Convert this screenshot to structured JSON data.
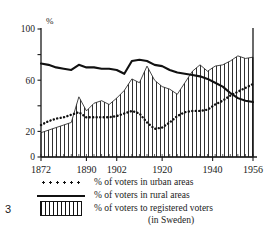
{
  "figure": {
    "number": "3"
  },
  "chart_data": {
    "type": "line",
    "title": "",
    "xlabel": "",
    "ylabel": "%",
    "unit_label": "%",
    "xlim": [
      1872,
      1956
    ],
    "ylim": [
      0,
      100
    ],
    "grid": false,
    "legend_position": "below",
    "y_ticks": [
      0,
      20,
      40,
      60,
      80,
      100
    ],
    "y_tick_labels": [
      "0",
      "20",
      "",
      "60",
      "",
      "100"
    ],
    "x_ticks": [
      1872,
      1890,
      1902,
      1920,
      1940,
      1956
    ],
    "x_tick_labels": [
      "1872",
      "1890",
      "1902",
      "1920",
      "1940",
      "1956"
    ],
    "annotation": "(in Sweden)",
    "series": [
      {
        "name": "% of voters in urban areas",
        "style": "dotted",
        "color": "#111111",
        "x": [
          1872,
          1875,
          1878,
          1881,
          1884,
          1887,
          1890,
          1893,
          1896,
          1899,
          1902,
          1905,
          1908,
          1911,
          1914,
          1917,
          1920,
          1923,
          1926,
          1929,
          1932,
          1935,
          1938,
          1941,
          1944,
          1947,
          1950,
          1953,
          1956
        ],
        "values": [
          25,
          28,
          30,
          31,
          33,
          35,
          31,
          31,
          31,
          31,
          32,
          34,
          36,
          34,
          27,
          22,
          23,
          27,
          32,
          35,
          36,
          36,
          37,
          41,
          44,
          48,
          51,
          54,
          57
        ]
      },
      {
        "name": "% of voters in rural areas",
        "style": "solid",
        "color": "#111111",
        "x": [
          1872,
          1875,
          1878,
          1881,
          1884,
          1887,
          1890,
          1893,
          1896,
          1899,
          1902,
          1905,
          1908,
          1911,
          1914,
          1917,
          1920,
          1923,
          1926,
          1929,
          1932,
          1935,
          1938,
          1941,
          1944,
          1947,
          1950,
          1953,
          1956
        ],
        "values": [
          73,
          72,
          70,
          69,
          68,
          72,
          70,
          70,
          69,
          69,
          68,
          65,
          75,
          76,
          75,
          72,
          71,
          68,
          66,
          65,
          64,
          63,
          61,
          58,
          55,
          50,
          46,
          44,
          43
        ]
      },
      {
        "name": "% of voters to registered voters",
        "style": "hatched-area",
        "color": "#111111",
        "x": [
          1872,
          1875,
          1878,
          1881,
          1884,
          1887,
          1890,
          1893,
          1896,
          1899,
          1902,
          1905,
          1908,
          1911,
          1914,
          1917,
          1920,
          1923,
          1926,
          1929,
          1932,
          1935,
          1938,
          1941,
          1944,
          1947,
          1950,
          1953,
          1956
        ],
        "values": [
          19,
          21,
          23,
          25,
          27,
          47,
          36,
          42,
          44,
          41,
          46,
          52,
          61,
          58,
          71,
          60,
          55,
          53,
          49,
          58,
          67,
          72,
          67,
          71,
          72,
          75,
          79,
          77,
          78
        ]
      }
    ]
  },
  "legend": {
    "items": [
      {
        "label": "% of voters in urban areas",
        "swatch": "dotted-line-swatch"
      },
      {
        "label": "% of voters in rural areas",
        "swatch": "solid-line-swatch"
      },
      {
        "label": "% of voters to registered voters",
        "swatch": "hatched-box-swatch"
      }
    ],
    "note": "(in Sweden)"
  }
}
